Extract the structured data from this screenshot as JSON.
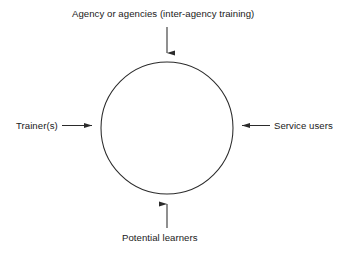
{
  "diagram": {
    "type": "influences-on-training-circle",
    "center_shape": {
      "name": "circle",
      "fill": "#ffffff",
      "stroke": "#2b2b2b",
      "stroke_width": 1,
      "cx": 167,
      "cy": 128,
      "r": 66
    },
    "labels": {
      "top": "Agency or agencies (inter-agency training)",
      "left": "Trainer(s)",
      "right": "Service users",
      "bottom": "Potential learners"
    },
    "arrows": [
      {
        "name": "arrow-top-down",
        "direction": "down",
        "from_label": "top"
      },
      {
        "name": "arrow-left-right",
        "direction": "right",
        "from_label": "left"
      },
      {
        "name": "arrow-right-left",
        "direction": "left",
        "from_label": "right"
      },
      {
        "name": "arrow-bottom-up",
        "direction": "up",
        "from_label": "bottom"
      }
    ],
    "colors": {
      "background": "#ffffff",
      "line": "#2b2b2b",
      "text": "#1a1a1a"
    }
  }
}
